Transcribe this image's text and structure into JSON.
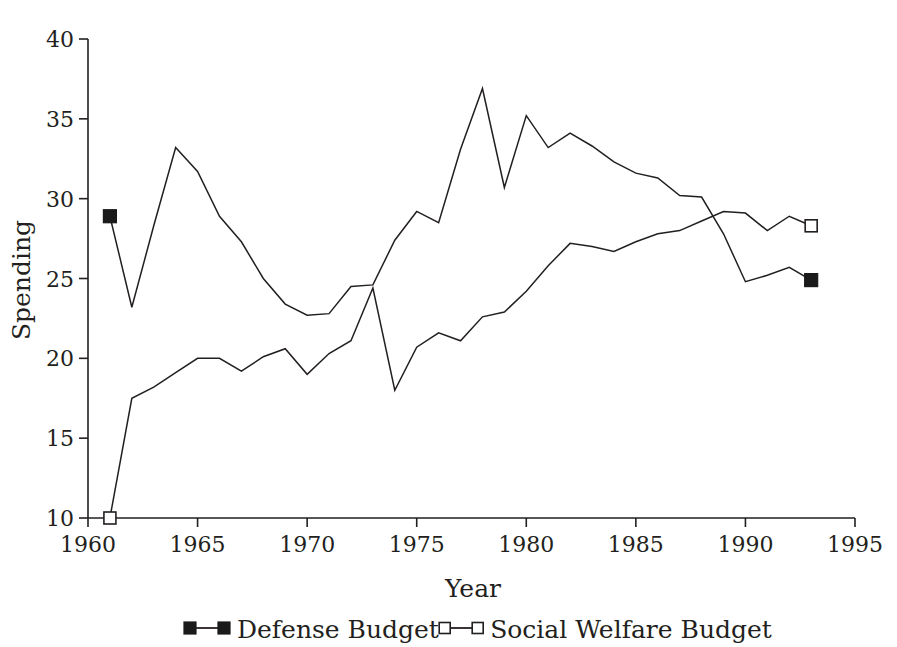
{
  "chart_data": {
    "type": "line",
    "title": "",
    "xlabel": "Year",
    "ylabel": "Spending",
    "xlim": [
      1960,
      1995
    ],
    "ylim": [
      10,
      40
    ],
    "xticks": [
      1960,
      1965,
      1970,
      1975,
      1980,
      1985,
      1990,
      1995
    ],
    "xtick_labels": [
      "1960",
      "1965",
      "1970",
      "1975",
      "1980",
      "1985",
      "1990",
      "1995"
    ],
    "yticks": [
      10,
      15,
      20,
      25,
      30,
      35,
      40
    ],
    "ytick_labels": [
      "10",
      "15",
      "20",
      "25",
      "30",
      "35",
      "40"
    ],
    "grid": false,
    "legend_position": "below",
    "x": [
      1961,
      1962,
      1963,
      1964,
      1965,
      1966,
      1967,
      1968,
      1969,
      1970,
      1971,
      1972,
      1973,
      1974,
      1975,
      1976,
      1977,
      1978,
      1979,
      1980,
      1981,
      1982,
      1983,
      1984,
      1985,
      1986,
      1987,
      1988,
      1989,
      1990,
      1991,
      1992,
      1993
    ],
    "series": [
      {
        "name": "Defense Budget",
        "marker": "filled-square",
        "marker_years": [
          1961,
          1993
        ],
        "values": [
          28.9,
          23.2,
          28.3,
          33.2,
          31.7,
          28.9,
          27.3,
          25.0,
          23.4,
          22.7,
          22.8,
          24.5,
          24.6,
          27.4,
          29.2,
          28.5,
          33.1,
          36.9,
          30.7,
          35.2,
          33.2,
          34.1,
          33.3,
          32.3,
          31.6,
          31.3,
          30.2,
          30.1,
          27.8,
          24.8,
          25.2,
          25.7,
          24.9
        ]
      },
      {
        "name": "Social Welfare Budget",
        "marker": "open-square",
        "marker_years": [
          1961,
          1993
        ],
        "values": [
          10.0,
          17.5,
          18.2,
          19.1,
          20.0,
          20.0,
          19.2,
          20.1,
          20.6,
          19.0,
          20.3,
          21.1,
          24.4,
          18.0,
          20.7,
          21.6,
          21.1,
          22.6,
          22.9,
          24.2,
          25.8,
          27.2,
          27.0,
          26.7,
          27.3,
          27.8,
          28.0,
          28.6,
          29.2,
          29.1,
          28.0,
          28.9,
          28.3
        ]
      }
    ]
  },
  "legend": {
    "entries": [
      {
        "label": "Defense Budget",
        "marker": "filled-square"
      },
      {
        "label": "Social Welfare Budget",
        "marker": "open-square"
      }
    ]
  },
  "axes": {
    "x_title": "Year",
    "y_title": "Spending"
  }
}
